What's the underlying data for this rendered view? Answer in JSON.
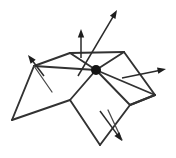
{
  "figure": {
    "background_color": "#ffffff",
    "line_color": "#323232",
    "accent_color": "#141414",
    "canvas": {
      "width": 176,
      "height": 158
    },
    "center_vertex": {
      "label": "central vertex",
      "x": 96,
      "y": 70,
      "radius": 5
    },
    "mesh_faces": [
      {
        "name": "left-face",
        "points": "34,66 70,53 96,70 70,100 12,120"
      },
      {
        "name": "top-right-face",
        "points": "70,53 124,52 155,95 96,70"
      },
      {
        "name": "bottom-face",
        "points": "96,70 130,105 100,145 70,100"
      }
    ],
    "mesh_edges": [
      {
        "name": "edge-left-to-ridge",
        "d": "M 34,66 L 70,53"
      },
      {
        "name": "edge-ridge-top",
        "d": "M 70,53 L 124,52"
      },
      {
        "name": "edge-ridge-right-down",
        "d": "M 124,52 L 155,95"
      },
      {
        "name": "edge-right-base",
        "d": "M 155,95 L 130,105"
      },
      {
        "name": "edge-center-to-left",
        "d": "M 34,66 L 96,70"
      },
      {
        "name": "edge-center-to-ridge",
        "d": "M 96,70 L 70,53"
      },
      {
        "name": "edge-center-to-topridge-right",
        "d": "M 96,70 L 124,52"
      },
      {
        "name": "edge-center-to-right-apex",
        "d": "M 96,70 L 155,95"
      },
      {
        "name": "edge-center-to-lower-left",
        "d": "M 96,70 L 70,100"
      },
      {
        "name": "edge-center-to-lower-right",
        "d": "M 96,70 L 130,105"
      },
      {
        "name": "edge-left-down",
        "d": "M 34,66 L 12,120"
      },
      {
        "name": "edge-bottom-left",
        "d": "M 12,120 L 70,100"
      },
      {
        "name": "edge-lower-diamond-left",
        "d": "M 70,100 L 100,145"
      },
      {
        "name": "edge-lower-diamond-right",
        "d": "M 100,145 L 130,105"
      },
      {
        "name": "edge-right-apex-to-lower",
        "d": "M 130,105 L 155,95"
      }
    ],
    "crease_marks": [
      {
        "name": "crease-left",
        "d": "M 34,66 L 52,92"
      },
      {
        "name": "crease-lower-center",
        "d": "M 108,110 L 122,140"
      }
    ],
    "vectors": [
      {
        "name": "normal-vector-long",
        "description": "long normal arrow from central vertex",
        "x1": 78,
        "y1": 76,
        "x2": 117,
        "y2": 10
      },
      {
        "name": "normal-vector-vertical",
        "description": "vertical arrow on top-left face",
        "x1": 81,
        "y1": 58,
        "x2": 81,
        "y2": 29
      },
      {
        "name": "tangent-vector-left",
        "description": "short arrow pointing up-left from left vertex",
        "x1": 44,
        "y1": 76,
        "x2": 28,
        "y2": 55
      },
      {
        "name": "tangent-vector-right",
        "description": "arrow pointing right from right face",
        "x1": 122,
        "y1": 78,
        "x2": 166,
        "y2": 69
      },
      {
        "name": "tangent-vector-bottom",
        "description": "arrow pointing down-right on lower face",
        "x1": 100,
        "y1": 111,
        "x2": 122,
        "y2": 141
      }
    ]
  }
}
